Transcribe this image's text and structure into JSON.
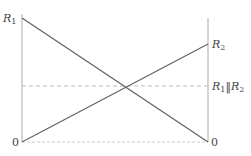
{
  "diagram": {
    "title": "",
    "labels": {
      "left_top": {
        "main": "R",
        "sub": "1"
      },
      "right_mid": {
        "main": "R",
        "sub": "2"
      },
      "right_dashed": {
        "a_main": "R",
        "a_sub": "1",
        "sep": "‖",
        "b_main": "R",
        "b_sub": "2"
      },
      "left_zero": "0",
      "right_zero": "0"
    },
    "lines": [
      {
        "name": "R1-line",
        "from": [
          22,
          18
        ],
        "to": [
          208,
          142
        ]
      },
      {
        "name": "R2-line",
        "from": [
          22,
          142
        ],
        "to": [
          208,
          44
        ]
      }
    ],
    "dashed_level": {
      "y": 86,
      "label": "R1 || R2"
    },
    "colors": {
      "line": "#666666",
      "axis": "#aaaaaa",
      "dashed": "#bbbbbb",
      "text": "#444444"
    }
  }
}
